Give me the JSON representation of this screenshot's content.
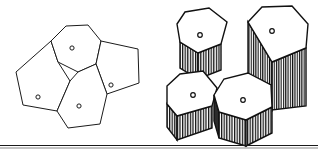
{
  "figure": {
    "caption": "",
    "background_color": "#ffffff",
    "line_color": "#1b1b1b",
    "hatch_color": "#111111",
    "dark_face_color": "#2b2b2b",
    "width": 318,
    "height": 152,
    "baseline": {
      "y": 146,
      "x_start": 0,
      "x_end": 318,
      "color": "#1a1a1a"
    },
    "panels": [
      {
        "id": "left-panel",
        "name": "two-dimensional-tessellation",
        "label": "",
        "cell_count": 4,
        "cells": [
          {
            "id": "cell-top",
            "name": "heptagon-cell-top",
            "sides": 7,
            "center": [
              72,
              48
            ],
            "marker": "circle",
            "points": "51,41 66,26 88,25 101,41 96,64 78,72 58,62"
          },
          {
            "id": "cell-left",
            "name": "pentagon-cell-left",
            "sides": 5,
            "center": [
              38,
              97
            ],
            "marker": "circle",
            "points": "51,41 58,62 70,81 57,111 23,105 16,72"
          },
          {
            "id": "cell-bottom",
            "name": "pentagon-cell-bottom",
            "sides": 5,
            "center": [
              79,
              106
            ],
            "marker": "circle",
            "points": "78,72 96,64 107,94 100,124 68,128 57,111 70,81"
          },
          {
            "id": "cell-right",
            "name": "pentagon-cell-right",
            "sides": 5,
            "center": [
              111,
              85
            ],
            "marker": "circle",
            "points": "96,64 101,41 138,49 139,83 107,94"
          }
        ]
      },
      {
        "id": "right-panel",
        "name": "three-dimensional-prism-stack",
        "label": "",
        "prism_count": 4,
        "hatch_pattern": "vertical-lines",
        "prisms": [
          {
            "id": "prism-back-left",
            "name": "prism-back-left",
            "marker": "circle",
            "center": [
              200,
              35
            ],
            "top_points": "177,24 185,12 209,8 227,22 221,44 198,53 180,42",
            "side_faces": [
              {
                "name": "side-face-hatched",
                "shading": "hatched",
                "points": "180,42 198,53 198,79 180,68"
              },
              {
                "name": "side-face-hatched",
                "shading": "hatched",
                "points": "198,53 221,44 221,70 198,79"
              }
            ]
          },
          {
            "id": "prism-back-right",
            "name": "prism-back-right",
            "marker": "circle",
            "center": [
              272,
              31
            ],
            "top_points": "248,22 262,7 292,6 308,24 306,48 272,62",
            "side_faces": [
              {
                "name": "side-face-hatched",
                "shading": "hatched",
                "points": "248,22 272,62 272,110 248,74"
              },
              {
                "name": "side-face-hatched",
                "shading": "hatched",
                "points": "272,62 306,48 306,106 272,110"
              }
            ]
          },
          {
            "id": "prism-front-left",
            "name": "prism-front-left",
            "marker": "circle",
            "center": [
              193,
              95
            ],
            "top_points": "167,86 180,74 203,71 217,88 212,106 177,116 167,104",
            "side_faces": [
              {
                "name": "side-face-hatched",
                "shading": "hatched",
                "points": "167,104 177,116 177,140 167,127"
              },
              {
                "name": "side-face-hatched",
                "shading": "hatched",
                "points": "177,116 212,106 212,128 177,140"
              }
            ]
          },
          {
            "id": "prism-front-center",
            "name": "prism-front-center",
            "marker": "circle",
            "center": [
              243,
              100
            ],
            "top_points": "214,95 224,79 248,73 271,85 272,107 246,120 219,112",
            "side_faces": [
              {
                "name": "side-face-dark",
                "shading": "solid-dark",
                "points": "214,95 219,112 219,138 214,121"
              },
              {
                "name": "side-face-hatched",
                "shading": "hatched",
                "points": "219,112 246,120 246,146 219,138"
              },
              {
                "name": "side-face-hatched",
                "shading": "hatched",
                "points": "246,120 272,107 272,133 246,146"
              }
            ]
          }
        ]
      }
    ]
  }
}
